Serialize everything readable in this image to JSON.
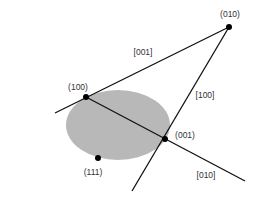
{
  "diagram": {
    "colors": {
      "background": "#ffffff",
      "ellipse_fill": "#b8b8b8",
      "line": "#111111",
      "point": "#000000",
      "text": "#333333"
    },
    "ellipse": {
      "cx": 118,
      "cy": 125,
      "rx": 52,
      "ry": 35
    },
    "points": [
      {
        "id": "p010",
        "label": "(010)",
        "x": 229,
        "y": 27,
        "lx": 230,
        "ly": 17
      },
      {
        "id": "p100",
        "label": "(100)",
        "x": 86,
        "y": 97,
        "lx": 78,
        "ly": 90
      },
      {
        "id": "p001",
        "label": "(001)",
        "x": 165,
        "y": 139,
        "lx": 185,
        "ly": 138
      },
      {
        "id": "p111",
        "label": "(111)",
        "x": 98,
        "y": 158,
        "lx": 93,
        "ly": 175
      }
    ],
    "lines": [
      {
        "id": "l001",
        "label": "[001]",
        "x1": 55,
        "y1": 113,
        "x2": 229,
        "y2": 27,
        "lx": 143,
        "ly": 55
      },
      {
        "id": "l100",
        "label": "[100]",
        "x1": 229,
        "y1": 27,
        "x2": 132,
        "y2": 191,
        "lx": 205,
        "ly": 98
      },
      {
        "id": "l010",
        "label": "[010]",
        "x1": 86,
        "y1": 97,
        "x2": 245,
        "y2": 181,
        "lx": 206,
        "ly": 178
      }
    ]
  }
}
